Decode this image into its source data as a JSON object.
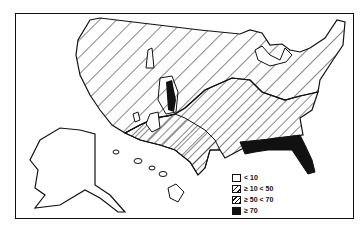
{
  "map": {
    "region": "United States (contiguous, Alaska, Hawaii)",
    "style": "black-and-white hatched choropleth",
    "colors": {
      "line": "#111111",
      "background": "#ffffff",
      "fill_max": "#111111"
    }
  },
  "legend": {
    "items": [
      {
        "label": "< 10",
        "pattern": "blank"
      },
      {
        "label": "≥ 10 < 50",
        "pattern": "wide-hatch"
      },
      {
        "label": "≥ 50 < 70",
        "pattern": "dense-hatch"
      },
      {
        "label": "≥ 70",
        "pattern": "solid"
      }
    ]
  },
  "zones": [
    {
      "name": "northern-west-band",
      "class": "≥ 10 < 50"
    },
    {
      "name": "southeast-central-band",
      "class": "≥ 50 < 70"
    },
    {
      "name": "florida-gulf-coast",
      "class": "≥ 70"
    },
    {
      "name": "utah-strip",
      "class": "≥ 70"
    },
    {
      "name": "alaska",
      "class": "< 10"
    },
    {
      "name": "hawaii",
      "class": "< 10"
    },
    {
      "name": "southwest-small-areas",
      "class": "< 10"
    }
  ]
}
